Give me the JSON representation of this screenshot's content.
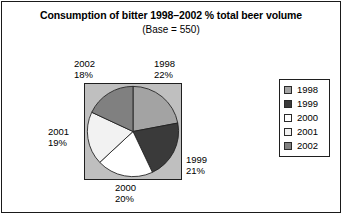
{
  "chart_data": {
    "type": "pie",
    "title": "Consumption of bitter 1998–2002 % total beer volume",
    "subtitle": "(Base = 550)",
    "base": 550,
    "categories": [
      "1998",
      "1999",
      "2000",
      "2001",
      "2002"
    ],
    "values": [
      22,
      21,
      20,
      19,
      18
    ],
    "value_unit": "%",
    "slice_colors": [
      "#a3a3a3",
      "#3a3a3a",
      "#ffffff",
      "#f2f2f2",
      "#808080"
    ],
    "start_angle_deg": 0,
    "direction": "clockwise",
    "legend_position": "right",
    "grid": false,
    "plot_background": "#bfbfbf",
    "slices": [
      {
        "label": "1998",
        "value": 22,
        "display": "22%",
        "color": "#a3a3a3"
      },
      {
        "label": "1999",
        "value": 21,
        "display": "21%",
        "color": "#3a3a3a"
      },
      {
        "label": "2000",
        "value": 20,
        "display": "20%",
        "color": "#ffffff"
      },
      {
        "label": "2001",
        "value": 19,
        "display": "19%",
        "color": "#f2f2f2"
      },
      {
        "label": "2002",
        "value": 18,
        "display": "18%",
        "color": "#808080"
      }
    ],
    "callouts": {
      "y2002": {
        "year": "2002",
        "pct": "18%"
      },
      "y1998": {
        "year": "1998",
        "pct": "22%"
      },
      "y1999": {
        "year": "1999",
        "pct": "21%"
      },
      "y2000": {
        "year": "2000",
        "pct": "20%"
      },
      "y2001": {
        "year": "2001",
        "pct": "19%"
      }
    },
    "legend": [
      {
        "label": "1998",
        "color": "#a3a3a3"
      },
      {
        "label": "1999",
        "color": "#3a3a3a"
      },
      {
        "label": "2000",
        "color": "#ffffff"
      },
      {
        "label": "2001",
        "color": "#f2f2f2"
      },
      {
        "label": "2002",
        "color": "#808080"
      }
    ]
  },
  "colors": {
    "frame": "#1a1a1a",
    "text": "#000000",
    "plot_bg": "#bfbfbf",
    "page_bg": "#ffffff"
  }
}
